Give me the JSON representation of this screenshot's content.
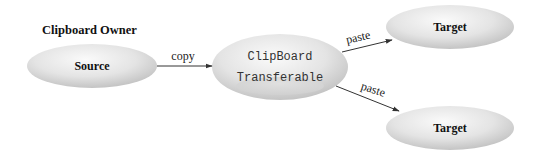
{
  "diagram": {
    "group_label": "Clipboard Owner",
    "nodes": {
      "source": {
        "label": "Source"
      },
      "clipboard": {
        "label": "ClipBoard",
        "inner_label": "Transferable"
      },
      "target_top": {
        "label": "Target"
      },
      "target_bottom": {
        "label": "Target"
      }
    },
    "edges": [
      {
        "from": "source",
        "to": "clipboard",
        "label": "copy"
      },
      {
        "from": "clipboard",
        "to": "target_top",
        "label": "paste"
      },
      {
        "from": "clipboard",
        "to": "target_bottom",
        "label": "paste"
      }
    ],
    "colors": {
      "node_fill_light": "#f7f7f7",
      "node_fill_dark": "#c8c8c8",
      "edge": "#333333",
      "text": "#111111"
    }
  }
}
